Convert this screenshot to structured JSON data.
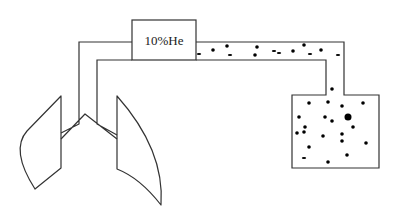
{
  "diagram": {
    "type": "helium-dilution-lung-volume-apparatus",
    "gas_source_box": {
      "label": "10%He",
      "x": 132,
      "y": 20,
      "width": 64,
      "height": 40
    },
    "colors": {
      "line": "#333333",
      "particle": "#000000",
      "background": "#ffffff"
    },
    "tube_to_lungs": {
      "outer_path": "M132,42 L79,42 L79,110",
      "inner_path": "M132,60 L97,60 L97,110"
    },
    "pipe_to_spirometer": {
      "top_path": "M196,42 L344,42 L344,95 L379,95 L379,168 L292,168 L292,95 L326,95 L326,60 L196,60"
    },
    "lungs": {
      "left_lung_path": "M61,96 L61,168 L35,189 Q10,150 27,131 Z",
      "right_lung_path": "M117,96 L117,169 Q140,178 161,205 Q165,150 117,96 Z",
      "bronchi_path": "M79,110 L79,124 L61,133 M97,110 L97,124 L117,135 M61,139 L85,114 L117,139"
    },
    "particles_in_pipe": [
      {
        "x": 199,
        "y": 54,
        "r": 1.3,
        "shape": "dash"
      },
      {
        "x": 213,
        "y": 50,
        "r": 1.8
      },
      {
        "x": 227,
        "y": 46,
        "r": 1.8
      },
      {
        "x": 230,
        "y": 55,
        "r": 1.3,
        "shape": "dash"
      },
      {
        "x": 257,
        "y": 47,
        "r": 1.8
      },
      {
        "x": 255,
        "y": 55,
        "r": 1.8
      },
      {
        "x": 274,
        "y": 51,
        "r": 1.3,
        "shape": "dash"
      },
      {
        "x": 279,
        "y": 53,
        "r": 1.3,
        "shape": "dash"
      },
      {
        "x": 293,
        "y": 51,
        "r": 1.8
      },
      {
        "x": 304,
        "y": 45,
        "r": 1.8
      },
      {
        "x": 310,
        "y": 54,
        "r": 1.3,
        "shape": "dash"
      },
      {
        "x": 321,
        "y": 50,
        "r": 1.8
      },
      {
        "x": 338,
        "y": 55,
        "r": 1.3,
        "shape": "dash"
      },
      {
        "x": 332,
        "y": 89,
        "r": 1.8
      }
    ],
    "particles_in_tank": [
      {
        "x": 309,
        "y": 103,
        "r": 1.8
      },
      {
        "x": 328,
        "y": 102,
        "r": 1.8
      },
      {
        "x": 342,
        "y": 106,
        "r": 1.8
      },
      {
        "x": 363,
        "y": 103,
        "r": 1.8
      },
      {
        "x": 299,
        "y": 117,
        "r": 1.8
      },
      {
        "x": 325,
        "y": 117,
        "r": 1.8
      },
      {
        "x": 332,
        "y": 121,
        "r": 1.8
      },
      {
        "x": 348,
        "y": 117,
        "r": 3.5
      },
      {
        "x": 353,
        "y": 127,
        "r": 1.8
      },
      {
        "x": 305,
        "y": 127,
        "r": 1.8
      },
      {
        "x": 297,
        "y": 133,
        "r": 1.8
      },
      {
        "x": 304,
        "y": 132,
        "r": 1.8
      },
      {
        "x": 323,
        "y": 136,
        "r": 1.8
      },
      {
        "x": 342,
        "y": 134,
        "r": 1.8
      },
      {
        "x": 342,
        "y": 141,
        "r": 1.8
      },
      {
        "x": 366,
        "y": 143,
        "r": 1.8
      },
      {
        "x": 309,
        "y": 147,
        "r": 1.8
      },
      {
        "x": 347,
        "y": 155,
        "r": 1.8
      },
      {
        "x": 304,
        "y": 158,
        "r": 1.3,
        "shape": "dash"
      },
      {
        "x": 328,
        "y": 162,
        "r": 1.8
      }
    ],
    "spirometer_tank": {
      "x": 292,
      "y": 95,
      "width": 87,
      "height": 73
    }
  }
}
